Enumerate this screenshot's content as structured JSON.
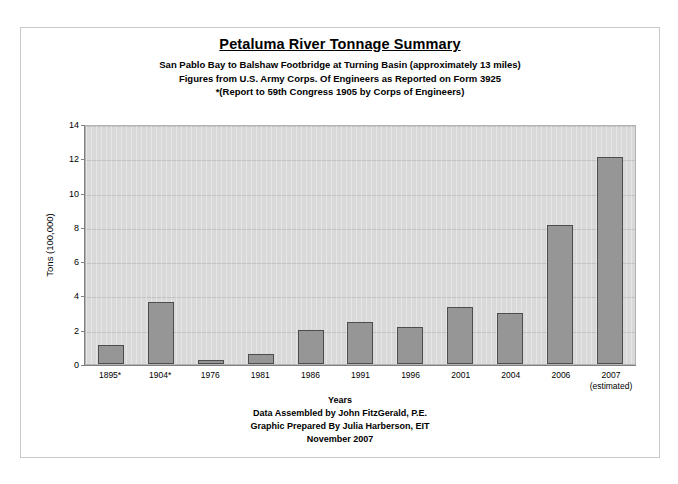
{
  "title": "Petaluma River Tonnage Summary",
  "subtitles": [
    "San Pablo Bay to Balshaw Footbridge at Turning Basin (approximately 13 miles)",
    "Figures from U.S. Army Corps. Of Engineers as Reported on Form 3925",
    "*(Report to 59th Congress 1905 by Corps of Engineers)"
  ],
  "footer": [
    "Years",
    "Data Assembled by John FitzGerald, P.E.",
    "Graphic Prepared By Julia Harberson, EIT",
    "November 2007"
  ],
  "colors": {
    "bar_fill": "#969696",
    "bar_border": "#4d4d4d",
    "plot_background": "#d9d9d9",
    "gridline": "#c2c2c2",
    "page_frame": "#c8c8c8",
    "text": "#000000"
  },
  "chart_data": {
    "type": "bar",
    "title": "Petaluma River Tonnage Summary",
    "xlabel": "Years",
    "ylabel": "Tons (100,000)",
    "ylim": [
      0,
      14
    ],
    "yticks": [
      0,
      2,
      4,
      6,
      8,
      10,
      12,
      14
    ],
    "grid": true,
    "legend": false,
    "categories": [
      "1895*",
      "1904*",
      "1976",
      "1981",
      "1986",
      "1991",
      "1996",
      "2001",
      "2004",
      "2006",
      "2007"
    ],
    "category_sublabels": [
      "",
      "",
      "",
      "",
      "",
      "",
      "",
      "",
      "",
      "",
      "(estimated)"
    ],
    "values": [
      1.1,
      3.6,
      0.25,
      0.6,
      2.0,
      2.45,
      2.15,
      3.3,
      3.0,
      8.1,
      12.1
    ]
  }
}
